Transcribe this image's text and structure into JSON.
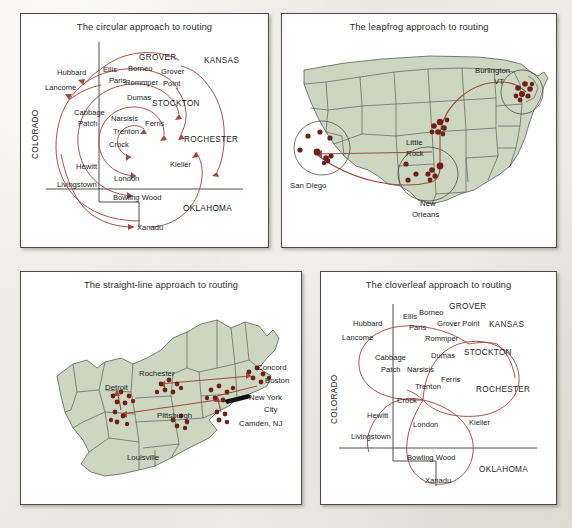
{
  "page": {
    "background_color": "#eceae4",
    "panel_background": "#ffffff",
    "panel_border_color": "#4a4a4a",
    "map_fill_color": "#ccd6c0",
    "map_border_color": "#4b4b4b",
    "route_color": "#9e4b3e",
    "city_dot_color": "#6e2119",
    "text_color": "#1d1d1d"
  },
  "panels": {
    "circular": {
      "title": "The circular approach to routing",
      "states": [
        "COLORADO",
        "KANSAS",
        "OKLAHOMA"
      ],
      "nodes": [
        "Hubbard",
        "Lancome",
        "Ellis",
        "Paris",
        "Borneo",
        "GROVER",
        "Grover",
        "Point",
        "Rommper",
        "Dumas",
        "STOCKTON",
        "Cabbage",
        "Patch",
        "Narsisis",
        "Trenton",
        "Crock",
        "Ferris",
        "ROCHESTER",
        "Hewitt",
        "London",
        "Kieller",
        "Livingstown",
        "Bowling Wood",
        "Xanadu"
      ]
    },
    "leapfrog": {
      "title": "The leapfrog approach to routing",
      "cities": [
        "San Diego",
        "New Orleans",
        "Little Rock",
        "Burlington VT"
      ],
      "city_labels": [
        {
          "name": "Burlington",
          "line2": "VT"
        },
        {
          "name": "Little",
          "line2": "Rock"
        },
        {
          "name": "San Diego",
          "line2": ""
        },
        {
          "name": "New",
          "line2": "Orleans"
        }
      ]
    },
    "straight": {
      "title": "The straight-line approach to routing",
      "cities": [
        "Detroit",
        "Rochester",
        "Concord",
        "Boston",
        "Pittsburgh",
        "New York",
        "City",
        "Camden, NJ",
        "Louisville"
      ]
    },
    "cloverleaf": {
      "title": "The cloverleaf approach to routing",
      "states": [
        "COLORADO",
        "KANSAS",
        "OKLAHOMA"
      ],
      "nodes": [
        "Hubbard",
        "Lancome",
        "Ellis",
        "Borneo",
        "Paris",
        "GROVER",
        "Grover Point",
        "Rommper",
        "Cabbage",
        "Patch",
        "Dumas",
        "STOCKTON",
        "Narsisis",
        "Ferris",
        "Trenton",
        "ROCHESTER",
        "Crock",
        "Hewitt",
        "London",
        "Kieller",
        "Livingstown",
        "Bowling Wood",
        "Xanadu"
      ]
    }
  }
}
